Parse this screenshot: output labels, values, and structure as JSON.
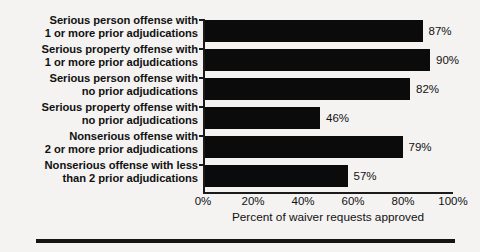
{
  "chart_data": {
    "type": "bar",
    "orientation": "horizontal",
    "title": "",
    "subtitle": "",
    "xlabel": "Percent of waiver requests approved",
    "ylabel": "",
    "xlim": [
      0,
      100
    ],
    "grid": false,
    "legend": null,
    "categories": [
      "Serious person offense with 1 or more prior adjudications",
      "Serious property offense with 1 or more prior adjudications",
      "Serious person offense with no prior adjudications",
      "Serious property offense with no prior adjudications",
      "Nonserious offense with 2 or more prior adjudications",
      "Nonserious offense with less than 2 prior adjudications"
    ],
    "category_lines": [
      [
        "Serious person offense with",
        "1 or more prior adjudications"
      ],
      [
        "Serious property offense with",
        "1 or more prior adjudications"
      ],
      [
        "Serious person offense with",
        "no prior adjudications"
      ],
      [
        "Serious property offense with",
        "no prior adjudications"
      ],
      [
        "Nonserious offense with",
        "2 or more prior adjudications"
      ],
      [
        "Nonserious offense with less",
        "than 2 prior adjudications"
      ]
    ],
    "values": [
      87,
      90,
      82,
      46,
      79,
      57
    ],
    "value_labels": [
      "87%",
      "90%",
      "82%",
      "46%",
      "79%",
      "57%"
    ],
    "xticks": [
      0,
      20,
      40,
      60,
      80,
      100
    ],
    "xtick_labels": [
      "0%",
      "20%",
      "40%",
      "60%",
      "80%",
      "100%"
    ],
    "bar_color": "#0b0b0b",
    "axis_color": "#1a1a1a",
    "background_color": "#f4f3f1"
  }
}
